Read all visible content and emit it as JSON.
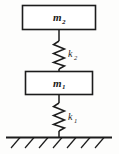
{
  "figure": {
    "type": "mass-spring-system-diagram",
    "background_color": "#fdfdfc",
    "line_color": "#1c1c1c",
    "upper_mass": {
      "label": "m",
      "subscript": "2",
      "full_label": "m2"
    },
    "lower_mass": {
      "label": "m",
      "subscript": "1",
      "full_label": "m1"
    },
    "upper_spring": {
      "label": "k",
      "subscript": "2",
      "full_label": "k2"
    },
    "lower_spring": {
      "label": "k",
      "subscript": "1",
      "full_label": "k1"
    },
    "ground": {
      "name": "fixed-support-hatching"
    }
  }
}
